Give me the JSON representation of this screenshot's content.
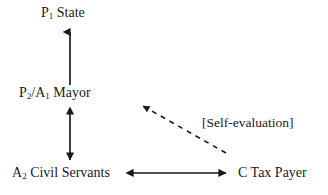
{
  "diagram": {
    "background_color": "#ffffff",
    "stroke_color": "#1a1a1a",
    "nodes": [
      {
        "id": "state",
        "name": "state-node",
        "prefix": "P",
        "subscript": "1",
        "label": " State",
        "full_text": "P1 State"
      },
      {
        "id": "mayor",
        "name": "mayor-node",
        "prefix": "P",
        "subscript": "2",
        "mid": "/A",
        "subscript2": "1",
        "label": " Mayor",
        "full_text": "P2/A1 Mayor"
      },
      {
        "id": "civil_servants",
        "name": "civil-servants-node",
        "prefix": "A",
        "subscript": "2",
        "label": " Civil Servants",
        "full_text": "A2 Civil Servants"
      },
      {
        "id": "tax_payer",
        "name": "tax-payer-node",
        "prefix": "C Tax Payer",
        "subscript": "",
        "label": "",
        "full_text": "C Tax Payer"
      }
    ],
    "annotations": [
      {
        "id": "self_evaluation",
        "name": "self-evaluation-annotation",
        "text": "[Self-evaluation]"
      }
    ],
    "edges": [
      {
        "id": "mayor-to-state",
        "name": "mayor-to-state-arrow",
        "style": "solid",
        "heads": "single-up",
        "from": "mayor",
        "to": "state",
        "x1": 70,
        "y1": 85,
        "x2": 70,
        "y2": 29
      },
      {
        "id": "mayor-civil-servants",
        "name": "mayor-civil-servants-arrow",
        "style": "solid",
        "heads": "double-vertical",
        "from": "mayor",
        "to": "civil_servants",
        "x1": 70,
        "y1": 110,
        "x2": 70,
        "y2": 163
      },
      {
        "id": "civil-servants-tax-payer",
        "name": "civil-servants-tax-payer-arrow",
        "style": "solid",
        "heads": "double-horizontal",
        "from": "civil_servants",
        "to": "tax_payer",
        "x1": 129,
        "y1": 173,
        "x2": 229,
        "y2": 173
      },
      {
        "id": "tax-payer-to-mayor",
        "name": "tax-payer-to-mayor-dashed-arrow",
        "style": "dashed",
        "heads": "single",
        "from": "tax_payer",
        "to": "mayor",
        "x1": 226,
        "y1": 153,
        "x2": 139,
        "y2": 104
      }
    ]
  }
}
